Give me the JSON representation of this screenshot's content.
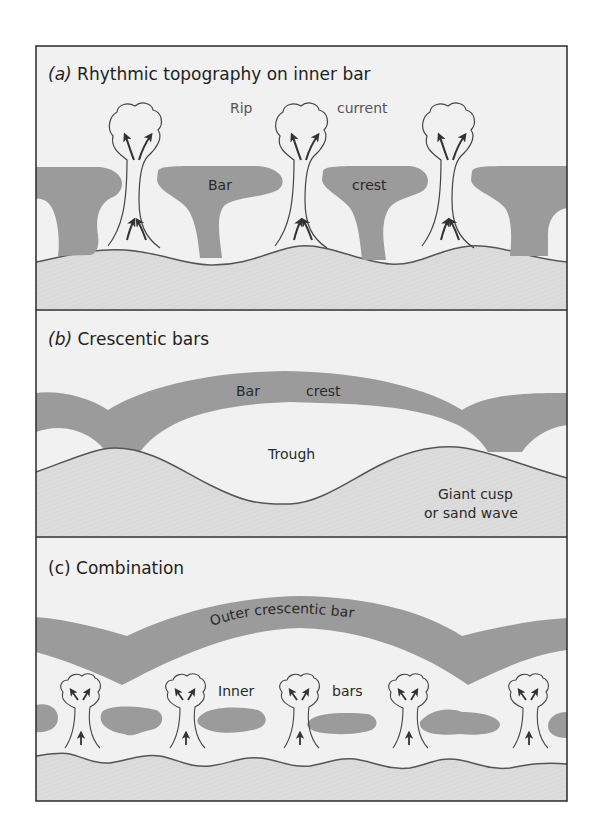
{
  "figure": {
    "colors": {
      "frame": "#2a2a2a",
      "water": "#f1f1f1",
      "bar": "#9b9b9b",
      "beach": "#dddddd",
      "outline": "#555555",
      "arrow": "#333333"
    },
    "panels": [
      {
        "id": "a",
        "letter": "(a)",
        "title": "Rhythmic topography on inner bar",
        "labels": {
          "rip": "Rip",
          "current": "current",
          "bar": "Bar",
          "crest": "crest"
        }
      },
      {
        "id": "b",
        "letter": "(b)",
        "title": "Crescentic bars",
        "labels": {
          "bar": "Bar",
          "crest": "crest",
          "trough": "Trough",
          "giant_cusp_line1": "Giant cusp",
          "giant_cusp_line2": "or sand wave"
        }
      },
      {
        "id": "c",
        "letter": "(c)",
        "title": "Combination",
        "labels": {
          "outer_bar": "Outer crescentic bar",
          "inner": "Inner",
          "bars": "bars"
        }
      }
    ]
  }
}
